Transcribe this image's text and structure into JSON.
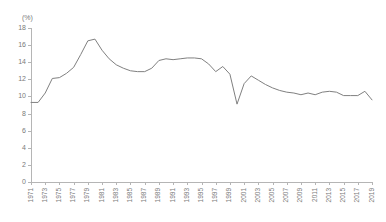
{
  "chart_data": {
    "type": "line",
    "title": "",
    "subtitle": "",
    "xlabel": "",
    "ylabel": "",
    "unit_label": "(%)",
    "grid": false,
    "legend": null,
    "ylim": [
      0,
      18
    ],
    "ytick_step": 2,
    "yticks": [
      0,
      2,
      4,
      6,
      8,
      10,
      12,
      14,
      16,
      18
    ],
    "ytick_labels": [
      "0",
      "2",
      "4",
      "6",
      "8",
      "10",
      "12",
      "14",
      "16",
      "18"
    ],
    "xlim": [
      1971,
      2019
    ],
    "xtick_step": 2,
    "xtick_labels": [
      "1971",
      "1973",
      "1975",
      "1977",
      "1979",
      "1981",
      "1983",
      "1985",
      "1987",
      "1989",
      "1991",
      "1993",
      "1995",
      "1997",
      "1999",
      "2001",
      "2003",
      "2005",
      "2007",
      "2009",
      "2011",
      "2013",
      "2015",
      "2017",
      "2019"
    ],
    "x": [
      1971,
      1972,
      1973,
      1974,
      1975,
      1976,
      1977,
      1978,
      1979,
      1980,
      1981,
      1982,
      1983,
      1984,
      1985,
      1986,
      1987,
      1988,
      1989,
      1990,
      1991,
      1992,
      1993,
      1994,
      1995,
      1996,
      1997,
      1998,
      1999,
      2000,
      2001,
      2002,
      2003,
      2004,
      2005,
      2006,
      2007,
      2008,
      2009,
      2010,
      2011,
      2012,
      2013,
      2014,
      2015,
      2016,
      2017,
      2018,
      2019
    ],
    "values": [
      9.3,
      9.3,
      10.4,
      12.1,
      12.2,
      12.7,
      13.4,
      14.9,
      16.5,
      16.7,
      15.4,
      14.4,
      13.7,
      13.3,
      13.0,
      12.9,
      12.9,
      13.3,
      14.2,
      14.4,
      14.3,
      14.4,
      14.5,
      14.5,
      14.4,
      13.8,
      12.9,
      13.5,
      12.6,
      9.1,
      11.5,
      12.4,
      11.9,
      11.4,
      11.0,
      10.7,
      10.5,
      10.4,
      10.2,
      10.4,
      10.2,
      10.5,
      10.6,
      10.5,
      10.1,
      10.1,
      10.1,
      10.6,
      9.6
    ],
    "series_color": "#808080",
    "axis_color": "#b5b5b5",
    "text_color": "#7a7a7a"
  }
}
